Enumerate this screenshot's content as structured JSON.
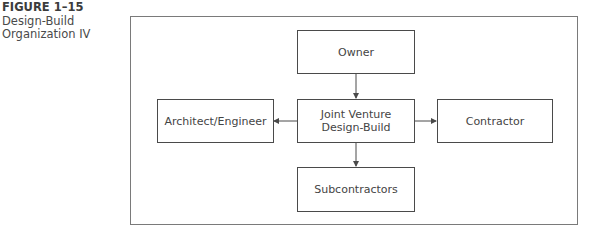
{
  "caption": {
    "figure_number": "FIGURE 1–15",
    "title_line1": "Design-Build",
    "title_line2": "Organization IV"
  },
  "diagram": {
    "nodes": {
      "owner": "Owner",
      "joint_venture_line1": "Joint Venture",
      "joint_venture_line2": "Design-Build",
      "architect_engineer": "Architect/Engineer",
      "contractor": "Contractor",
      "subcontractors": "Subcontractors"
    },
    "edges": [
      {
        "from": "Owner",
        "to": "Joint Venture Design-Build"
      },
      {
        "from": "Joint Venture Design-Build",
        "to": "Architect/Engineer"
      },
      {
        "from": "Joint Venture Design-Build",
        "to": "Contractor"
      },
      {
        "from": "Joint Venture Design-Build",
        "to": "Subcontractors"
      }
    ],
    "colors": {
      "line": "#4a4a4a",
      "frame": "#7a7a7a",
      "text": "#444444"
    }
  }
}
